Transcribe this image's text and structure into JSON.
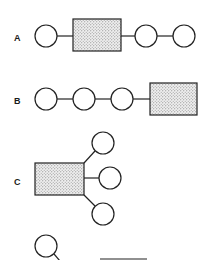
{
  "diagram": {
    "type": "structural-schematic",
    "style": {
      "stroke_color": "#222222",
      "fill_pattern": "dot-stipple",
      "background": "#ffffff"
    },
    "panels": [
      {
        "label": "A",
        "layout": "linear",
        "sequence": [
          "circle",
          "rectangle",
          "circle",
          "circle"
        ]
      },
      {
        "label": "B",
        "layout": "linear",
        "sequence": [
          "circle",
          "circle",
          "circle",
          "rectangle"
        ]
      },
      {
        "label": "C",
        "layout": "branched",
        "center": "rectangle",
        "branches": [
          "circle",
          "circle",
          "circle"
        ]
      }
    ],
    "partial_panel": {
      "visible": [
        "circle",
        "diagonal-line",
        "horizontal-line"
      ],
      "note": "cropped at bottom edge"
    }
  }
}
